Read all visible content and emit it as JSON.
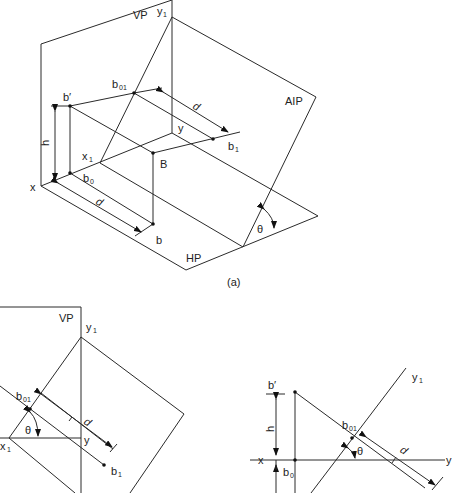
{
  "figures": [
    {
      "id": "a",
      "caption": "(a)",
      "planes": {
        "vertical": "VP",
        "horizontal": "HP",
        "auxiliary": "AIP"
      },
      "points": {
        "x": "x",
        "y": "y",
        "x1": "x",
        "x1_sub": "1",
        "y1": "y",
        "y1_sub": "1",
        "b_prime": "b′",
        "b0": "b",
        "b0_sub": "0",
        "b01": "b",
        "b01_sub": "01",
        "b1": "b",
        "b1_sub": "1",
        "B": "B",
        "b": "b"
      },
      "dimensions": {
        "height": "h",
        "distance_top": "d",
        "distance_bottom": "d",
        "angle": "θ"
      }
    },
    {
      "id": "b",
      "planes": {
        "vertical": "VP"
      },
      "points": {
        "x1": "x",
        "x1_sub": "1",
        "y1": "y",
        "y1_sub": "1",
        "y": "y",
        "b01": "b",
        "b01_sub": "01",
        "b1": "b",
        "b1_sub": "1"
      },
      "dimensions": {
        "distance": "d",
        "angle": "θ"
      }
    },
    {
      "id": "c",
      "points": {
        "x": "x",
        "y": "y",
        "y1": "y",
        "y1_sub": "1",
        "b_prime": "b′",
        "b0": "b",
        "b0_sub": "0",
        "b01": "b",
        "b01_sub": "01"
      },
      "dimensions": {
        "height": "h",
        "distance": "d",
        "angle": "θ"
      }
    }
  ]
}
